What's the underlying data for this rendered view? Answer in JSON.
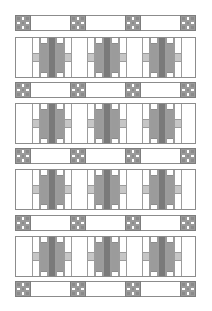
{
  "diagram": {
    "type": "quilt-layout",
    "colors": {
      "background": "#ffffff",
      "outline": "#8c8c8c",
      "ninepatch_gray": "#8a8a8a",
      "center_bar_dark": "#7a7a7a",
      "side_bar_mid": "#9b9b9b",
      "accent_light": "#c6c6c6"
    },
    "sashing_rows_top": [
      15,
      82,
      148,
      215,
      281
    ],
    "block_rows_top": [
      37,
      103,
      169,
      236
    ],
    "ninepatch_x": [
      15,
      70,
      125,
      180
    ],
    "unit_x": [
      16,
      71,
      126
    ],
    "blocks_per_row": 3,
    "ninepatch_per_sash": 4
  }
}
